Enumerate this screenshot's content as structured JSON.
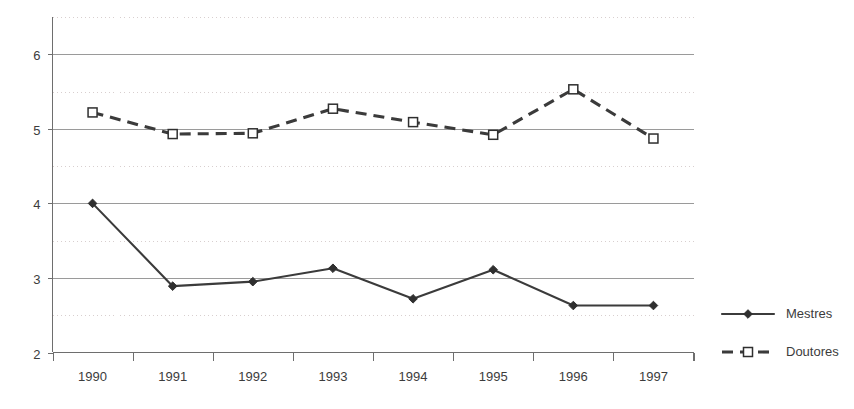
{
  "chart_data": {
    "type": "line",
    "title": "",
    "subtitle": "",
    "xlabel": "",
    "ylabel": "",
    "categories": [
      "1990",
      "1991",
      "1992",
      "1993",
      "1994",
      "1995",
      "1996",
      "1997"
    ],
    "series": [
      {
        "name": "Mestres",
        "marker": "filled-diamond",
        "line_style": "solid",
        "color": "#3b3b3b",
        "values": [
          4.0,
          2.89,
          2.95,
          3.13,
          2.72,
          3.11,
          2.63,
          2.63
        ]
      },
      {
        "name": "Doutores",
        "marker": "open-square",
        "line_style": "dashed",
        "color": "#3b3b3b",
        "values": [
          5.22,
          4.93,
          4.94,
          5.27,
          5.09,
          4.92,
          5.53,
          4.87
        ]
      }
    ],
    "ylim": [
      2,
      6.5
    ],
    "y_major_ticks": [
      2,
      3,
      4,
      5,
      6
    ],
    "y_minor_ticks": [
      2.5,
      3.5,
      4.5,
      5.5,
      6.5
    ],
    "y_tick_labels": [
      "2",
      "3",
      "4",
      "5",
      "6"
    ],
    "grid": {
      "major_horizontal": true,
      "minor_horizontal": true,
      "vertical": false
    },
    "legend": {
      "position": "right",
      "entries": [
        "Mestres",
        "Doutores"
      ]
    }
  }
}
